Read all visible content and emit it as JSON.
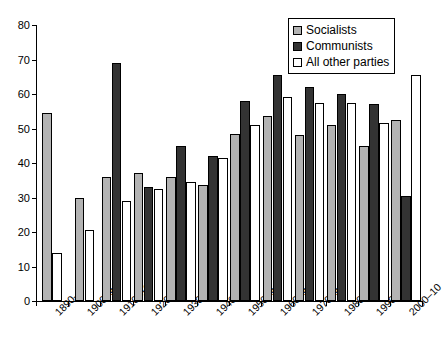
{
  "chart_data": {
    "type": "bar",
    "title": "",
    "xlabel": "",
    "ylabel": "",
    "ylim": [
      0,
      80
    ],
    "yticks": [
      0,
      10,
      20,
      30,
      40,
      50,
      60,
      70,
      80
    ],
    "grid": false,
    "legend_position": "top-right",
    "categories": [
      "1890–9",
      "1900–9",
      "1910–19",
      "1920–9",
      "1930–9",
      "1940–9",
      "1950–9",
      "1960–9",
      "1970–9",
      "1980–9",
      "1990–9",
      "2000–10"
    ],
    "series": [
      {
        "name": "Socialists",
        "color": "#b3b3b3",
        "values": [
          54.5,
          30,
          36,
          37,
          36,
          33.5,
          48.5,
          53.5,
          48,
          51,
          45,
          52.5
        ]
      },
      {
        "name": "Communists",
        "color": "#333333",
        "values": [
          null,
          null,
          69,
          33,
          45,
          42,
          58,
          65.5,
          62,
          60,
          57,
          30.5
        ]
      },
      {
        "name": "All other parties",
        "color": "#ffffff",
        "values": [
          14,
          20.5,
          29,
          32.5,
          34.5,
          41.5,
          51,
          59,
          57.5,
          57.5,
          51.5,
          65.5
        ]
      }
    ]
  },
  "legend": {
    "items": [
      {
        "label": "Socialists",
        "swatch": "socialists"
      },
      {
        "label": "Communists",
        "swatch": "communists"
      },
      {
        "label": "All other parties",
        "swatch": "other"
      }
    ]
  }
}
